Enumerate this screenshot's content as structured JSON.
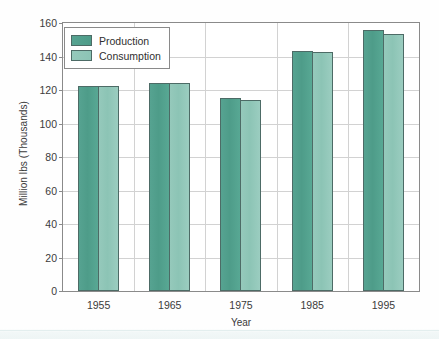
{
  "chart_data": {
    "type": "bar",
    "title": "",
    "xlabel": "Year",
    "ylabel": "Million lbs (Thousands)",
    "categories": [
      "1955",
      "1965",
      "1975",
      "1985",
      "1995"
    ],
    "series": [
      {
        "name": "Production",
        "color": "#4e9c89",
        "values": [
          122.5,
          124,
          115,
          143,
          156
        ]
      },
      {
        "name": "Consumption",
        "color": "#8cc4b5",
        "values": [
          122.5,
          124,
          114,
          142.5,
          153.5
        ]
      }
    ],
    "ylim": [
      0,
      160
    ],
    "yticks": [
      0,
      20,
      40,
      60,
      80,
      100,
      120,
      140,
      160
    ],
    "ytick_labels": [
      "0",
      "20",
      "40",
      "60",
      "80",
      "100",
      "120",
      "140",
      "160"
    ],
    "grid": {
      "horizontal": true,
      "vertical": true
    },
    "legend": {
      "position": "top-left",
      "entries": [
        "Production",
        "Consumption"
      ]
    }
  },
  "axes": {
    "y_title": "Million lbs (Thousands)",
    "x_title": "Year"
  }
}
